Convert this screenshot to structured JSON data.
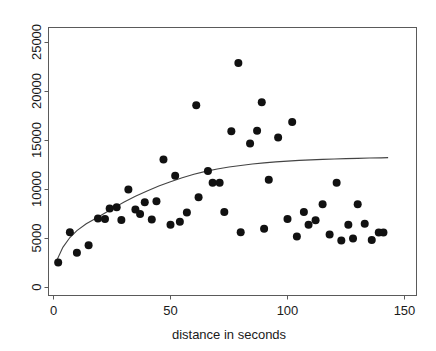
{
  "chart_data": {
    "type": "scatter",
    "title": "",
    "xlabel": "distance in seconds",
    "ylabel": "",
    "xlim": [
      -3,
      153
    ],
    "ylim": [
      -700,
      26300
    ],
    "grid": false,
    "legend": null,
    "xticks": [
      0,
      50,
      100,
      150
    ],
    "xtick_labels": [
      "0",
      "50",
      "100",
      "150"
    ],
    "yticks": [
      0,
      5000,
      10000,
      15000,
      20000,
      25000
    ],
    "ytick_labels": [
      "0",
      "5000",
      "10000",
      "15000",
      "20000",
      "25000"
    ],
    "ytick_label_rotation": -90,
    "point_color": "#111111",
    "curve_color": "#444444",
    "frame_color": "#5a5a5a",
    "marker": "filled-circle",
    "marker_size_px": 4,
    "series": [
      {
        "name": "observations",
        "x": [
          2,
          7,
          10,
          15,
          19,
          22,
          24,
          27,
          29,
          32,
          35,
          37,
          39,
          42,
          44,
          47,
          50,
          52,
          54,
          57,
          61,
          62,
          66,
          68,
          71,
          73,
          76,
          79,
          80,
          84,
          87,
          89,
          90,
          92,
          96,
          100,
          102,
          104,
          107,
          109,
          112,
          115,
          118,
          121,
          123,
          126,
          128,
          130,
          133,
          136,
          139,
          141
        ],
        "y": [
          2550,
          5650,
          3550,
          4300,
          7050,
          7000,
          8050,
          8200,
          6900,
          10000,
          7950,
          7500,
          8700,
          6950,
          8800,
          13050,
          6400,
          11400,
          6700,
          7650,
          18600,
          9200,
          11900,
          10700,
          10700,
          7700,
          15950,
          22900,
          5650,
          14700,
          16000,
          18900,
          6000,
          11000,
          15300,
          7000,
          16900,
          5200,
          7700,
          6400,
          6850,
          8500,
          5400,
          10700,
          4800,
          6400,
          5000,
          8500,
          6500,
          4850,
          5600,
          5600
        ]
      }
    ],
    "fit_curve": {
      "name": "smoothed fit",
      "x": [
        1,
        4,
        7,
        10,
        14,
        18,
        22,
        26,
        30,
        35,
        40,
        45,
        50,
        55,
        60,
        65,
        70,
        75,
        80,
        85,
        90,
        95,
        100,
        105,
        110,
        115,
        120,
        125,
        130,
        135,
        140,
        143
      ],
      "y": [
        2550,
        4100,
        5100,
        5800,
        6500,
        7050,
        7600,
        8150,
        8700,
        9300,
        9850,
        10350,
        10800,
        11200,
        11550,
        11850,
        12100,
        12300,
        12450,
        12600,
        12720,
        12820,
        12900,
        12970,
        13020,
        13070,
        13110,
        13150,
        13180,
        13210,
        13230,
        13250
      ]
    }
  },
  "axis": {
    "x_title": "distance in seconds"
  }
}
